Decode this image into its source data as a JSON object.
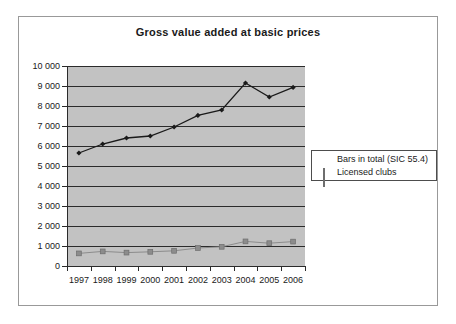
{
  "chart_data": {
    "type": "line",
    "title": "Gross value added at basic prices",
    "xlabel": "",
    "ylabel": "",
    "categories": [
      "1997",
      "1998",
      "1999",
      "2000",
      "2001",
      "2002",
      "2003",
      "2004",
      "2005",
      "2006"
    ],
    "ylim": [
      0,
      10000
    ],
    "ytick_labels": [
      "10 000",
      "9 000",
      "8 000",
      "7 000",
      "6 000",
      "5 000",
      "4 000",
      "3 000",
      "2 000",
      "1 000",
      "0"
    ],
    "ytick_values": [
      10000,
      9000,
      8000,
      7000,
      6000,
      5000,
      4000,
      3000,
      2000,
      1000,
      0
    ],
    "grid": true,
    "legend_position": "right",
    "series": [
      {
        "name": "Bars in total (SIC 55.4)",
        "marker": "diamond",
        "color": "#1a1a1a",
        "values": [
          5650,
          6100,
          6400,
          6500,
          6950,
          7530,
          7800,
          9150,
          8450,
          8930
        ]
      },
      {
        "name": "Licensed clubs",
        "marker": "square",
        "color": "#8c8c8c",
        "values": [
          630,
          730,
          670,
          710,
          760,
          900,
          960,
          1230,
          1140,
          1220
        ]
      }
    ]
  },
  "legend": {
    "items": [
      {
        "label": "Bars in total (SIC 55.4)",
        "marker": "diamond-marker"
      },
      {
        "label": "Licensed clubs",
        "marker": "square-marker"
      }
    ]
  }
}
